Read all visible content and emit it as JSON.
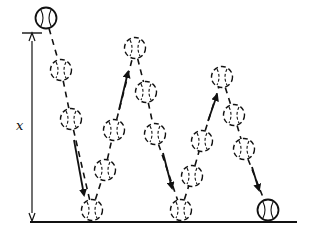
{
  "diagram": {
    "label_height": "x",
    "colors": {
      "ink": "#111111",
      "background": "#ffffff"
    },
    "ground": {
      "y": 222,
      "x1": 30,
      "x2": 297
    },
    "height_marker": {
      "x": 32,
      "y_top": 33,
      "y_bottom": 221
    },
    "balls": [
      {
        "x": 46,
        "y": 18,
        "style": "solid"
      },
      {
        "x": 61,
        "y": 70,
        "style": "dashed"
      },
      {
        "x": 71,
        "y": 119,
        "style": "dashed"
      },
      {
        "x": 92,
        "y": 210,
        "style": "dashed"
      },
      {
        "x": 105,
        "y": 170,
        "style": "dashed"
      },
      {
        "x": 114,
        "y": 130,
        "style": "dashed"
      },
      {
        "x": 135,
        "y": 48,
        "style": "dashed"
      },
      {
        "x": 146,
        "y": 92,
        "style": "dashed"
      },
      {
        "x": 155,
        "y": 134,
        "style": "dashed"
      },
      {
        "x": 181,
        "y": 210,
        "style": "dashed"
      },
      {
        "x": 192,
        "y": 176,
        "style": "dashed"
      },
      {
        "x": 202,
        "y": 141,
        "style": "dashed"
      },
      {
        "x": 222,
        "y": 77,
        "style": "dashed"
      },
      {
        "x": 234,
        "y": 115,
        "style": "dashed"
      },
      {
        "x": 244,
        "y": 149,
        "style": "dashed"
      },
      {
        "x": 268,
        "y": 210,
        "style": "solid"
      }
    ],
    "arrows": [
      {
        "x1": 74,
        "y1": 140,
        "x2": 84,
        "y2": 195,
        "direction": "down"
      },
      {
        "x1": 119,
        "y1": 110,
        "x2": 128,
        "y2": 72,
        "direction": "up"
      },
      {
        "x1": 163,
        "y1": 153,
        "x2": 172,
        "y2": 188,
        "direction": "down"
      },
      {
        "x1": 208,
        "y1": 121,
        "x2": 217,
        "y2": 95,
        "direction": "up"
      },
      {
        "x1": 252,
        "y1": 167,
        "x2": 259,
        "y2": 190,
        "direction": "down"
      }
    ]
  }
}
